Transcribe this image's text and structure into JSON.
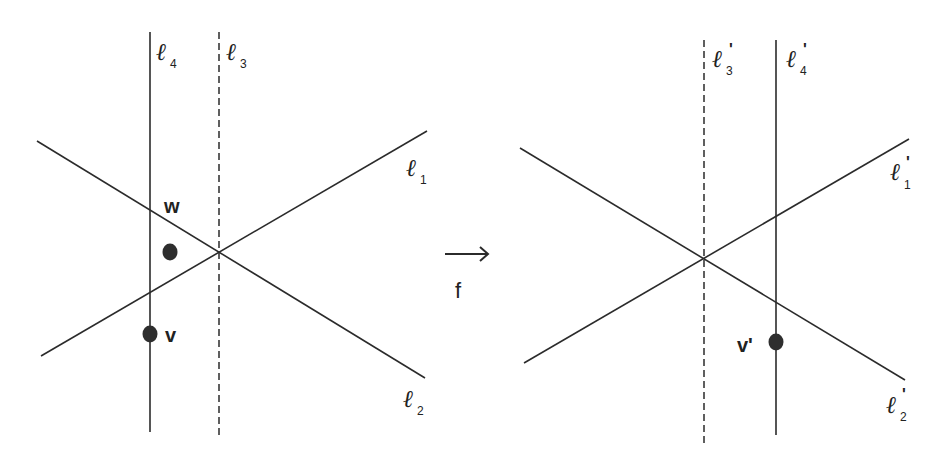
{
  "diagram": {
    "map_label": "f",
    "arrow_glyph": "→",
    "line_glyph": "ℓ",
    "prime_mark": "'",
    "left_panel": {
      "lines": [
        {
          "id": "l1",
          "name": "ℓ",
          "subscript": "1",
          "style": "solid",
          "x1": 41,
          "y1": 356,
          "x2": 427,
          "y2": 131
        },
        {
          "id": "l2",
          "name": "ℓ",
          "subscript": "2",
          "style": "solid",
          "x1": 37,
          "y1": 141,
          "x2": 425,
          "y2": 378
        },
        {
          "id": "l3",
          "name": "ℓ",
          "subscript": "3",
          "style": "dashed",
          "x1": 219,
          "y1": 32,
          "x2": 219,
          "y2": 437
        },
        {
          "id": "l4",
          "name": "ℓ",
          "subscript": "4",
          "style": "solid",
          "x1": 150,
          "y1": 32,
          "x2": 150,
          "y2": 432
        }
      ],
      "points": [
        {
          "id": "w",
          "label": "w",
          "cx": 170,
          "cy": 252
        },
        {
          "id": "v",
          "label": "v",
          "cx": 150,
          "cy": 334
        }
      ]
    },
    "right_panel": {
      "lines": [
        {
          "id": "l1p",
          "name": "ℓ",
          "subscript": "1",
          "prime": true,
          "style": "solid",
          "x1": 524,
          "y1": 363,
          "x2": 909,
          "y2": 139
        },
        {
          "id": "l2p",
          "name": "ℓ",
          "subscript": "2",
          "prime": true,
          "style": "solid",
          "x1": 520,
          "y1": 148,
          "x2": 905,
          "y2": 380
        },
        {
          "id": "l3p",
          "name": "ℓ",
          "subscript": "3",
          "prime": true,
          "style": "dashed",
          "x1": 704,
          "y1": 40,
          "x2": 704,
          "y2": 443
        },
        {
          "id": "l4p",
          "name": "ℓ",
          "subscript": "4",
          "prime": true,
          "style": "solid",
          "x1": 776,
          "y1": 40,
          "x2": 776,
          "y2": 435
        }
      ],
      "points": [
        {
          "id": "vp",
          "label": "v'",
          "cx": 776,
          "cy": 342
        }
      ]
    }
  }
}
